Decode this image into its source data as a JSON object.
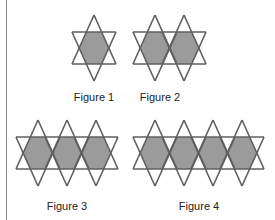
{
  "diagram": {
    "colors": {
      "fill": "#9b9b9b",
      "stroke": "#5f5f5f",
      "background": "#ffffff"
    },
    "figures": [
      {
        "label": "Figure 1",
        "stars": 1,
        "centers_x": [
          94
        ],
        "top_y": 15,
        "label_x": 94,
        "label_y": 91
      },
      {
        "label": "Figure 2",
        "stars": 2,
        "centers_x": [
          155,
          184
        ],
        "top_y": 15,
        "label_x": 160,
        "label_y": 91
      },
      {
        "label": "Figure 3",
        "stars": 3,
        "centers_x": [
          38,
          67,
          96
        ],
        "top_y": 120,
        "label_x": 67,
        "label_y": 200
      },
      {
        "label": "Figure 4",
        "stars": 4,
        "centers_x": [
          155,
          184,
          213,
          242
        ],
        "top_y": 120,
        "label_x": 199,
        "label_y": 200
      }
    ],
    "geometry": {
      "half_width": 22,
      "star_height": 66,
      "band_top_offset": 17,
      "band_bottom_offset": 49
    }
  }
}
